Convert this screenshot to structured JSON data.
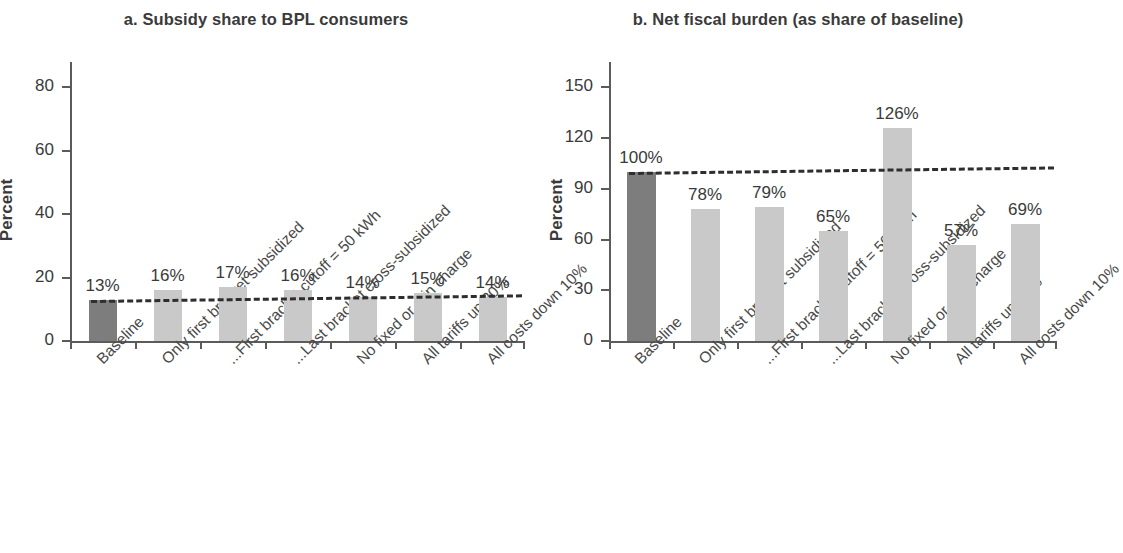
{
  "figure": {
    "panel_a_title": "a. Subsidy share to BPL consumers",
    "panel_b_title": "b. Net fiscal burden (as share of baseline)",
    "y_axis_title": "Percent",
    "bar_color_baseline": "#7d7d7d",
    "bar_color_scenario": "#c9c9c9",
    "reference_line_color": "#2e2e2e"
  },
  "chart_data": [
    {
      "type": "bar",
      "title": "a. Subsidy share to BPL consumers",
      "xlabel": "",
      "ylabel": "Percent",
      "ylim": [
        0,
        88
      ],
      "yticks": [
        0,
        20,
        40,
        60,
        80
      ],
      "grid": false,
      "legend": "none",
      "categories": [
        "Baseline",
        "Only first bracket subsidized",
        "...First bracket cutoff = 50 kWh",
        "...Last bracket cross-subsidized",
        "No fixed or min charge",
        "All tariffs up 20%",
        "All costs down 10%"
      ],
      "values": [
        13,
        16,
        17,
        16,
        14,
        15,
        14
      ],
      "value_labels": [
        "13%",
        "16%",
        "17%",
        "16%",
        "14%",
        "15%",
        "14%"
      ],
      "reference_line": {
        "value": 13,
        "style": "dashed",
        "note": "baseline level"
      }
    },
    {
      "type": "bar",
      "title": "b. Net fiscal burden (as share of baseline)",
      "xlabel": "",
      "ylabel": "Percent",
      "ylim": [
        0,
        165
      ],
      "yticks": [
        0,
        30,
        60,
        90,
        120,
        150
      ],
      "grid": false,
      "legend": "none",
      "categories": [
        "Baseline",
        "Only first bracket subsidized",
        "...First bracket cutoff = 50 kWh",
        "...Last bracket cross-subsidized",
        "No fixed or min charge",
        "All tariffs up 20%",
        "All costs down 10%"
      ],
      "values": [
        100,
        78,
        79,
        65,
        126,
        57,
        69
      ],
      "value_labels": [
        "100%",
        "78%",
        "79%",
        "65%",
        "126%",
        "57%",
        "69%"
      ],
      "reference_line": {
        "value": 100,
        "style": "dashed",
        "note": "baseline level"
      }
    }
  ]
}
